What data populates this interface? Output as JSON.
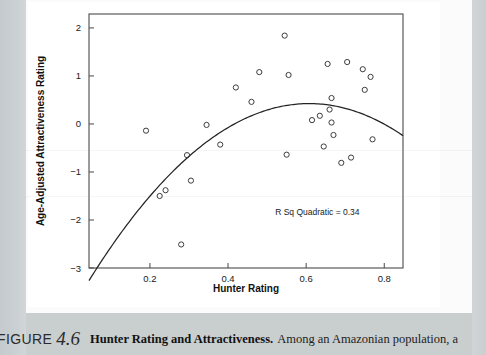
{
  "figure": {
    "label": "FIGURE",
    "number": "4.6",
    "title": "Hunter Rating and Attractiveness.",
    "body_text": "Among an Amazonian population, a"
  },
  "colors": {
    "page_background": "#cdd2d4",
    "paper": "#fbfbfb",
    "figure_panel": "#ffffff",
    "axis": "#3a3a3a",
    "marker_stroke": "#3c3c3c",
    "curve": "#242424",
    "text": "#111111"
  },
  "chart_data": {
    "type": "scatter",
    "title": "",
    "xlabel": "Hunter Rating",
    "ylabel": "Age-Adjusted Attractiveness Rating",
    "xlim": [
      0.044,
      0.848
    ],
    "ylim": [
      -3,
      2.29
    ],
    "xticks": [
      0.2,
      0.4,
      0.6,
      0.8
    ],
    "xticklabels": [
      "0.2",
      "0.4",
      "0.6",
      "0.8"
    ],
    "yticks": [
      2,
      1,
      0,
      -1,
      -2,
      -3
    ],
    "yticklabels": [
      "2",
      "1",
      "0",
      "-1",
      "-2",
      "-3"
    ],
    "grid": false,
    "legend": null,
    "annotations": [
      {
        "text": "R Sq Quadratic = 0.34",
        "x": 0.7,
        "y": -1.9
      }
    ],
    "marker": {
      "shape": "circle-open",
      "radius_px": 2.6
    },
    "points": [
      {
        "x": 0.19,
        "y": -0.14
      },
      {
        "x": 0.225,
        "y": -1.5
      },
      {
        "x": 0.24,
        "y": -1.38
      },
      {
        "x": 0.28,
        "y": -2.51
      },
      {
        "x": 0.295,
        "y": -0.65
      },
      {
        "x": 0.305,
        "y": -1.18
      },
      {
        "x": 0.345,
        "y": -0.02
      },
      {
        "x": 0.38,
        "y": -0.43
      },
      {
        "x": 0.42,
        "y": 0.76
      },
      {
        "x": 0.46,
        "y": 0.46
      },
      {
        "x": 0.48,
        "y": 1.08
      },
      {
        "x": 0.545,
        "y": 1.84
      },
      {
        "x": 0.55,
        "y": -0.64
      },
      {
        "x": 0.555,
        "y": 1.02
      },
      {
        "x": 0.615,
        "y": 0.08
      },
      {
        "x": 0.635,
        "y": 0.17
      },
      {
        "x": 0.645,
        "y": -0.47
      },
      {
        "x": 0.655,
        "y": 1.25
      },
      {
        "x": 0.66,
        "y": 0.3
      },
      {
        "x": 0.665,
        "y": 0.54
      },
      {
        "x": 0.665,
        "y": 0.03
      },
      {
        "x": 0.67,
        "y": -0.23
      },
      {
        "x": 0.69,
        "y": -0.81
      },
      {
        "x": 0.705,
        "y": 1.29
      },
      {
        "x": 0.715,
        "y": -0.7
      },
      {
        "x": 0.745,
        "y": 1.14
      },
      {
        "x": 0.75,
        "y": 0.71
      },
      {
        "x": 0.765,
        "y": 0.98
      },
      {
        "x": 0.77,
        "y": -0.32
      }
    ],
    "fit": {
      "type": "quadratic",
      "r_squared": 0.34,
      "label": "R Sq Quadratic = 0.34",
      "coefficients": {
        "a": -11.6,
        "b": 14.1,
        "c": -3.86
      },
      "vertex": {
        "x": 0.607,
        "y": 0.43
      }
    }
  }
}
